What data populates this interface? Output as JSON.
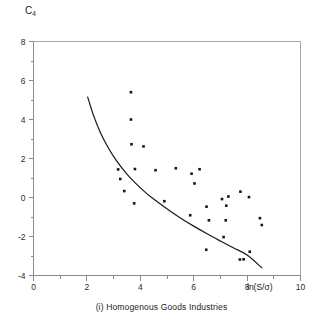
{
  "chart_data": {
    "type": "scatter",
    "title": "",
    "caption": "(i) Homogenous Goods Industries",
    "xlabel": "ln(S/σ)",
    "ylabel": "C̄4",
    "ylabel_base": "C",
    "ylabel_accent": "˜",
    "ylabel_subscript": "4",
    "xlim": [
      0,
      10
    ],
    "ylim": [
      -4,
      8
    ],
    "xticks": [
      0,
      2,
      4,
      6,
      8,
      10
    ],
    "yticks": [
      -4,
      -2,
      0,
      2,
      4,
      6,
      8
    ],
    "xtick_labels": [
      "0",
      "2",
      "4",
      "6",
      "8",
      "10"
    ],
    "ytick_labels": [
      "-4",
      "-2",
      "0",
      "2",
      "4",
      "6",
      "8"
    ],
    "xminor_step": 1,
    "yminor_step": 1,
    "grid": false,
    "legend": false,
    "marker": "filled-square",
    "marker_color": "#151515",
    "points": [
      {
        "x": 3.65,
        "y": 5.4
      },
      {
        "x": 3.65,
        "y": 4.0
      },
      {
        "x": 3.67,
        "y": 2.73
      },
      {
        "x": 4.12,
        "y": 2.62
      },
      {
        "x": 3.17,
        "y": 1.44
      },
      {
        "x": 3.8,
        "y": 1.46
      },
      {
        "x": 4.57,
        "y": 1.4
      },
      {
        "x": 5.33,
        "y": 1.5
      },
      {
        "x": 5.92,
        "y": 1.22
      },
      {
        "x": 6.22,
        "y": 1.45
      },
      {
        "x": 3.25,
        "y": 0.95
      },
      {
        "x": 6.03,
        "y": 0.72
      },
      {
        "x": 3.4,
        "y": 0.33
      },
      {
        "x": 7.75,
        "y": 0.3
      },
      {
        "x": 7.3,
        "y": 0.05
      },
      {
        "x": 8.07,
        "y": 0.02
      },
      {
        "x": 7.06,
        "y": -0.08
      },
      {
        "x": 4.9,
        "y": -0.19
      },
      {
        "x": 3.77,
        "y": -0.3
      },
      {
        "x": 7.22,
        "y": -0.42
      },
      {
        "x": 6.48,
        "y": -0.47
      },
      {
        "x": 5.87,
        "y": -0.91
      },
      {
        "x": 8.48,
        "y": -1.06
      },
      {
        "x": 6.57,
        "y": -1.17
      },
      {
        "x": 7.2,
        "y": -1.17
      },
      {
        "x": 8.55,
        "y": -1.41
      },
      {
        "x": 7.12,
        "y": -2.03
      },
      {
        "x": 6.47,
        "y": -2.68
      },
      {
        "x": 8.1,
        "y": -2.78
      },
      {
        "x": 7.73,
        "y": -3.18
      },
      {
        "x": 7.87,
        "y": -3.17
      }
    ],
    "fit_curve": {
      "label": "envelope",
      "points": [
        {
          "x": 2.03,
          "y": 5.15
        },
        {
          "x": 2.25,
          "y": 4.2
        },
        {
          "x": 2.5,
          "y": 3.35
        },
        {
          "x": 2.8,
          "y": 2.55
        },
        {
          "x": 3.1,
          "y": 1.9
        },
        {
          "x": 3.45,
          "y": 1.28
        },
        {
          "x": 3.8,
          "y": 0.76
        },
        {
          "x": 4.2,
          "y": 0.25
        },
        {
          "x": 4.6,
          "y": -0.18
        },
        {
          "x": 5.05,
          "y": -0.63
        },
        {
          "x": 5.5,
          "y": -1.05
        },
        {
          "x": 6.0,
          "y": -1.47
        },
        {
          "x": 6.5,
          "y": -1.86
        },
        {
          "x": 7.0,
          "y": -2.23
        },
        {
          "x": 7.5,
          "y": -2.59
        },
        {
          "x": 8.0,
          "y": -2.95
        },
        {
          "x": 8.55,
          "y": -3.6
        }
      ]
    }
  }
}
